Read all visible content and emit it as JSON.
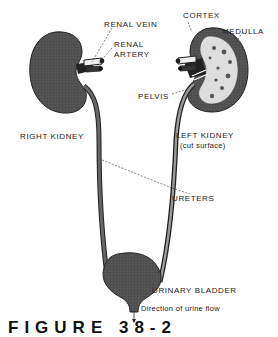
{
  "labels": {
    "renal_vein": "RENAL VEIN",
    "renal_artery_1": "RENAL",
    "renal_artery_2": "ARTERY",
    "cortex": "CORTEX",
    "medulla": "MEDULLA",
    "pelvis": "PELVIS",
    "right_kidney": "RIGHT KIDNEY",
    "left_kidney": "LEFT KIDNEY",
    "left_kidney_note": "(cut surface)",
    "ureters": "URETERS",
    "urinary_bladder": "URINARY BLADDER",
    "urine_flow": "Direction of urine flow"
  },
  "caption": "FIGURE 38-2",
  "colors": {
    "organ_fill": "#4a4a4a",
    "line": "#222222",
    "background": "#ffffff"
  }
}
